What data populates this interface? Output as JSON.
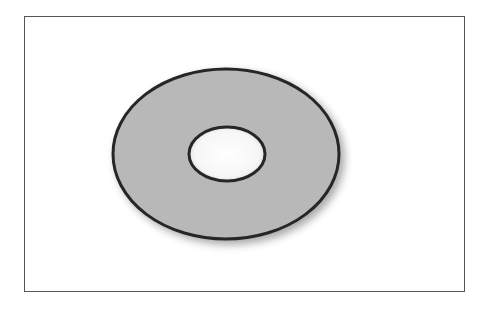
{
  "figure": {
    "frame": {
      "x": 24,
      "y": 16,
      "width": 441,
      "height": 276,
      "stroke": "#555555"
    },
    "outer_ellipse": {
      "cx": 226,
      "cy": 154,
      "rx": 113,
      "ry": 85,
      "fill": "#b8b8b8",
      "stroke": "#262626",
      "stroke_width": 3
    },
    "inner_ellipse": {
      "cx": 227,
      "cy": 154,
      "rx": 38,
      "ry": 27,
      "fill": "#ffffff",
      "stroke": "#262626",
      "stroke_width": 3
    },
    "shadow": {
      "color": "#000000",
      "opacity": 0.35,
      "blur": 4,
      "dx": 4,
      "dy": 4
    }
  }
}
